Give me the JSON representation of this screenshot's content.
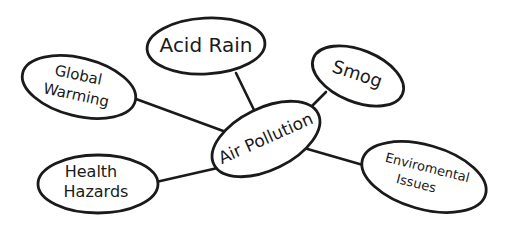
{
  "diagram": {
    "type": "concept-map",
    "center": {
      "id": "air-pollution",
      "label": "Air Pollution"
    },
    "nodes": [
      {
        "id": "acid-rain",
        "line1": "Acid Rain",
        "line2": ""
      },
      {
        "id": "global-warming",
        "line1": "Global",
        "line2": "Warming"
      },
      {
        "id": "smog",
        "line1": "Smog",
        "line2": ""
      },
      {
        "id": "health-hazards",
        "line1": "Health",
        "line2": "Hazards"
      },
      {
        "id": "enviromental-issues",
        "line1": "Enviromental",
        "line2": "Issues"
      }
    ],
    "edges": [
      {
        "from": "air-pollution",
        "to": "acid-rain"
      },
      {
        "from": "air-pollution",
        "to": "global-warming"
      },
      {
        "from": "air-pollution",
        "to": "smog"
      },
      {
        "from": "air-pollution",
        "to": "health-hazards"
      },
      {
        "from": "air-pollution",
        "to": "enviromental-issues"
      }
    ],
    "colors": {
      "stroke": "#1a1a1a",
      "fill": "#ffffff",
      "background": "#ffffff"
    }
  }
}
